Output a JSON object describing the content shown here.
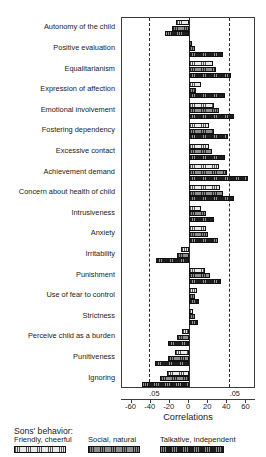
{
  "chart_data": {
    "type": "bar",
    "orientation": "horizontal",
    "title": "",
    "xlabel": "Correlations",
    "ylabel": "",
    "xlim": [
      -70,
      70
    ],
    "xticks": [
      -60,
      -40,
      -20,
      0,
      20,
      40,
      60
    ],
    "xticklabels": [
      "-60",
      "-40",
      "-20",
      "0",
      "20",
      "40",
      "60"
    ],
    "grid": false,
    "legend_position": "bottom",
    "significance_lines": {
      "label": ".05",
      "negative_value": -42,
      "positive_value": 42,
      "labels": [
        ".05",
        ".05"
      ]
    },
    "categories": [
      "Autonomy of the child",
      "Positive evaluation",
      "Equalitarianism",
      "Expression of affection",
      "Emotional involvement",
      "Fostering dependency",
      "Excessive contact",
      "Achievement demand",
      "Concern about health of child",
      "Intrusiveness",
      "Anxiety",
      "Irritability",
      "Punishment",
      "Use of fear to control",
      "Strictness",
      "Perceive child as a burden",
      "Punitiveness",
      "Ignoring"
    ],
    "series": [
      {
        "name": "Friendly, cheerful",
        "values": [
          -14,
          3,
          25,
          13,
          26,
          21,
          21,
          31,
          32,
          13,
          18,
          -8,
          17,
          8,
          4,
          -7,
          -15,
          -23
        ]
      },
      {
        "name": "Social, natural",
        "values": [
          -18,
          6,
          28,
          7,
          31,
          26,
          24,
          40,
          36,
          18,
          20,
          -13,
          22,
          6,
          6,
          -13,
          -22,
          -30
        ]
      },
      {
        "name": "Talkative, independent",
        "values": [
          -25,
          36,
          44,
          38,
          47,
          41,
          38,
          62,
          47,
          26,
          30,
          -35,
          33,
          10,
          9,
          -22,
          -36,
          -49
        ]
      }
    ]
  },
  "legend": {
    "title": "Sons' behavior:",
    "items": [
      {
        "label": "Friendly, cheerful"
      },
      {
        "label": "Social, natural"
      },
      {
        "label": "Talkative, independent"
      }
    ]
  }
}
